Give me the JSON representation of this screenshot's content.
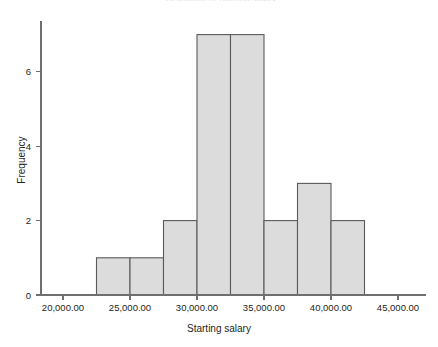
{
  "figure": {
    "title_remnant": "Histogram of Starting salary",
    "background_color": "#ffffff"
  },
  "chart_data": {
    "type": "bar",
    "chart_subtype": "histogram",
    "title": "",
    "xlabel": "Starting salary",
    "ylabel": "Frequency",
    "xlim": [
      20000,
      45000
    ],
    "ylim": [
      0,
      7.4
    ],
    "grid": false,
    "legend": false,
    "bin_width": 2500,
    "bin_edges": [
      22500,
      25000,
      27500,
      30000,
      32500,
      35000,
      37500,
      40000,
      42500
    ],
    "bin_centers": [
      23750,
      26250,
      28750,
      31250,
      33750,
      36250,
      38750,
      41250
    ],
    "categories": [
      "22,500-25,000",
      "25,000-27,500",
      "27,500-30,000",
      "30,000-32,500",
      "32,500-35,000",
      "35,000-37,500",
      "37,500-40,000",
      "40,000-42,500"
    ],
    "values": [
      1,
      1,
      2,
      7,
      7,
      2,
      3,
      2
    ],
    "total_count": 25,
    "xticks": [
      20000,
      25000,
      30000,
      35000,
      40000,
      45000
    ],
    "xtick_labels": [
      "20,000.00",
      "25,000.00",
      "30,000.00",
      "35,000.00",
      "40,000.00",
      "45,000.00"
    ],
    "yticks": [
      0,
      2,
      4,
      6
    ],
    "ytick_labels": [
      "0",
      "2",
      "4",
      "6"
    ],
    "bar_fill_color": "#dcdcdc",
    "bar_edge_color": "#5a5a5a",
    "axis_color": "#6f6f6f"
  },
  "axes": {
    "x_title": "Starting salary",
    "y_title": "Frequency"
  }
}
